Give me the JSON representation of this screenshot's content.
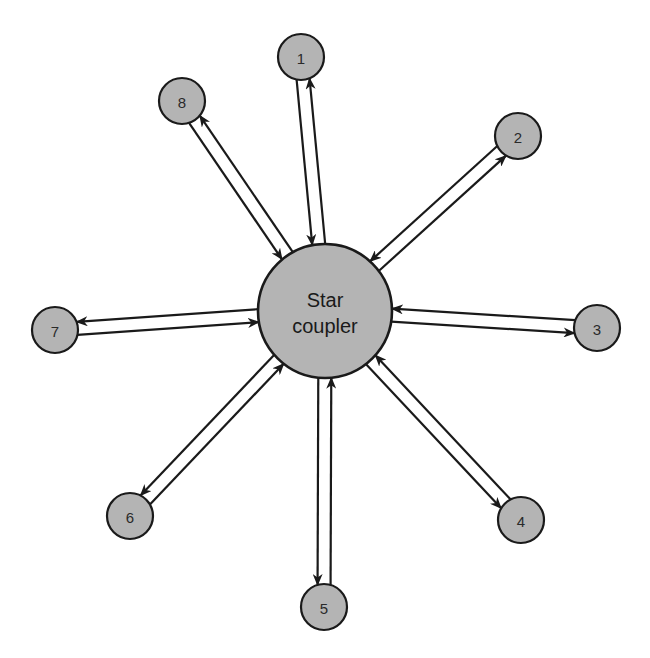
{
  "diagram": {
    "type": "star-topology",
    "hub": {
      "label_line1": "Star",
      "label_line2": "coupler",
      "cx": 325,
      "cy": 311,
      "r": 67
    },
    "node_radius": 23,
    "nodes": [
      {
        "id": "1",
        "label": "1",
        "cx": 301,
        "cy": 57
      },
      {
        "id": "2",
        "label": "2",
        "cx": 518,
        "cy": 136
      },
      {
        "id": "3",
        "label": "3",
        "cx": 597,
        "cy": 328
      },
      {
        "id": "4",
        "label": "4",
        "cx": 521,
        "cy": 520
      },
      {
        "id": "5",
        "label": "5",
        "cx": 324,
        "cy": 607
      },
      {
        "id": "6",
        "label": "6",
        "cx": 130,
        "cy": 516
      },
      {
        "id": "7",
        "label": "7",
        "cx": 55,
        "cy": 330
      },
      {
        "id": "8",
        "label": "8",
        "cx": 182,
        "cy": 101
      }
    ],
    "links_per_node": [
      {
        "direction": "to_hub",
        "description": "transmit fiber into star coupler"
      },
      {
        "direction": "from_hub",
        "description": "receive fiber from star coupler"
      }
    ],
    "colors": {
      "fill": "#b4b4b4",
      "stroke": "#1a1a1a",
      "background": "#ffffff"
    }
  }
}
